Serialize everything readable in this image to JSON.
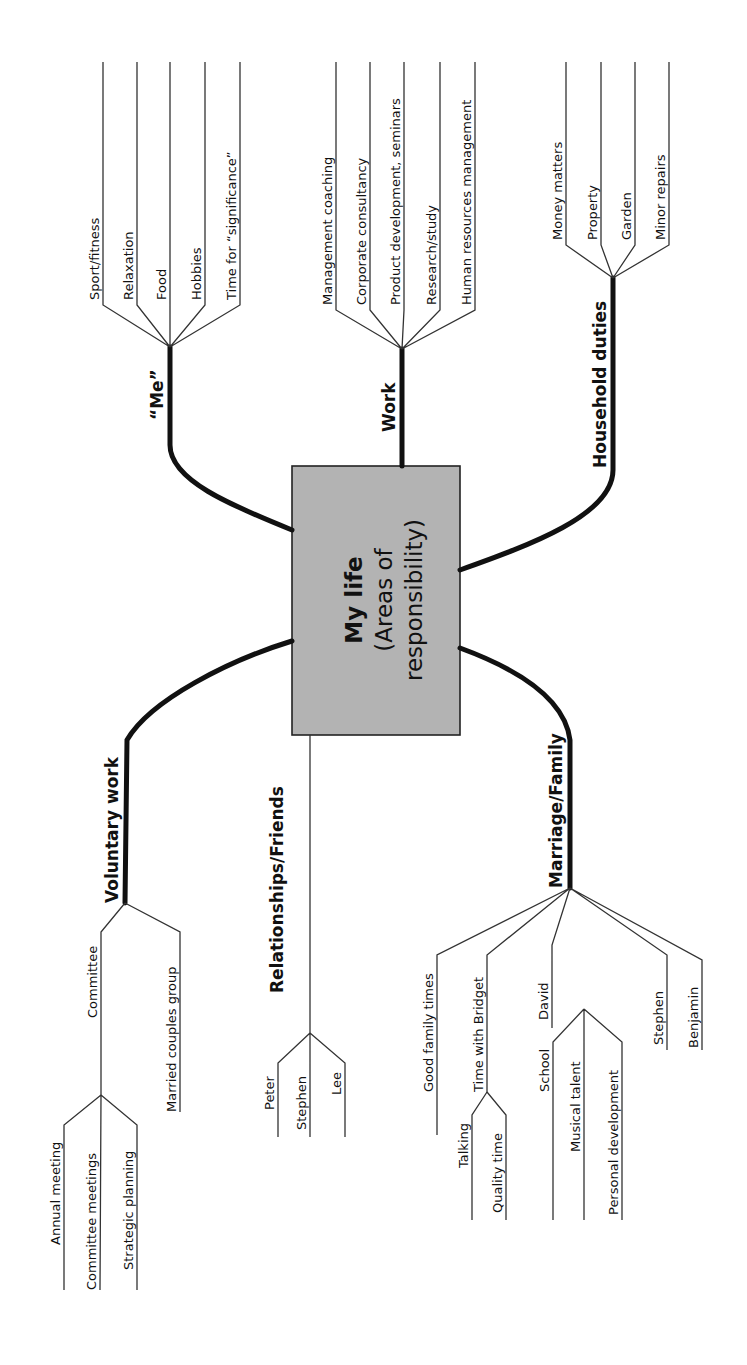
{
  "center": {
    "title": "My life",
    "subtitle_line1": "(Areas of",
    "subtitle_line2": "responsibility)",
    "fill": "#b3b3b3"
  },
  "branches": {
    "me": {
      "label": "“Me”",
      "children": [
        "Sport/fitness",
        "Relaxation",
        "Food",
        "Hobbies",
        "Time for “significance”"
      ]
    },
    "work": {
      "label": "Work",
      "children": [
        "Management coaching",
        "Corporate consultancy",
        "Product development, seminars",
        "Research/study",
        "Human resources management"
      ]
    },
    "household": {
      "label": "Household duties",
      "children": [
        "Money matters",
        "Property",
        "Garden",
        "Minor repairs"
      ]
    },
    "voluntary": {
      "label": "Voluntary work",
      "children": [
        {
          "label": "Committee",
          "children": [
            "Annual meeting",
            "Committee meetings",
            "Strategic planning"
          ]
        },
        {
          "label": "Married couples group"
        }
      ]
    },
    "relationships": {
      "label": "Relationships/Friends",
      "children": [
        "Peter",
        "Stephen",
        "Lee"
      ]
    },
    "family": {
      "label": "Marriage/Family",
      "children": [
        {
          "label": "Good family times"
        },
        {
          "label": "Time with Bridget",
          "children": [
            "Talking",
            "Quality time"
          ]
        },
        {
          "label": "David",
          "children": [
            "School",
            "Musical talent",
            "Personal development"
          ]
        },
        {
          "label": "Stephen"
        },
        {
          "label": "Benjamin"
        }
      ]
    }
  }
}
